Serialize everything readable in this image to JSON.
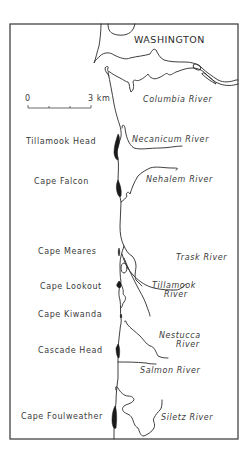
{
  "map": {
    "state_label": "WASHINGTON",
    "scale": {
      "start_label": "0",
      "end_label": "3 km"
    },
    "headlands": [
      {
        "name": "Tillamook Head"
      },
      {
        "name": "Cape Falcon"
      },
      {
        "name": "Cape Meares"
      },
      {
        "name": "Cape Lookout"
      },
      {
        "name": "Cape Kiwanda"
      },
      {
        "name": "Cascade Head"
      },
      {
        "name": "Cape Foulweather"
      }
    ],
    "rivers": [
      {
        "name": "Columbia River"
      },
      {
        "name": "Necanicum River"
      },
      {
        "name": "Nehalem River"
      },
      {
        "name": "Trask River"
      },
      {
        "name": "Tillamook",
        "name_line2": "River"
      },
      {
        "name": "Nestucca",
        "name_line2": "River"
      },
      {
        "name": "Salmon River"
      },
      {
        "name": "Siletz River"
      }
    ],
    "colors": {
      "line": "#2a2a2a",
      "headland_fill": "#1a1a1a",
      "border": "#444444",
      "background": "#ffffff"
    }
  }
}
